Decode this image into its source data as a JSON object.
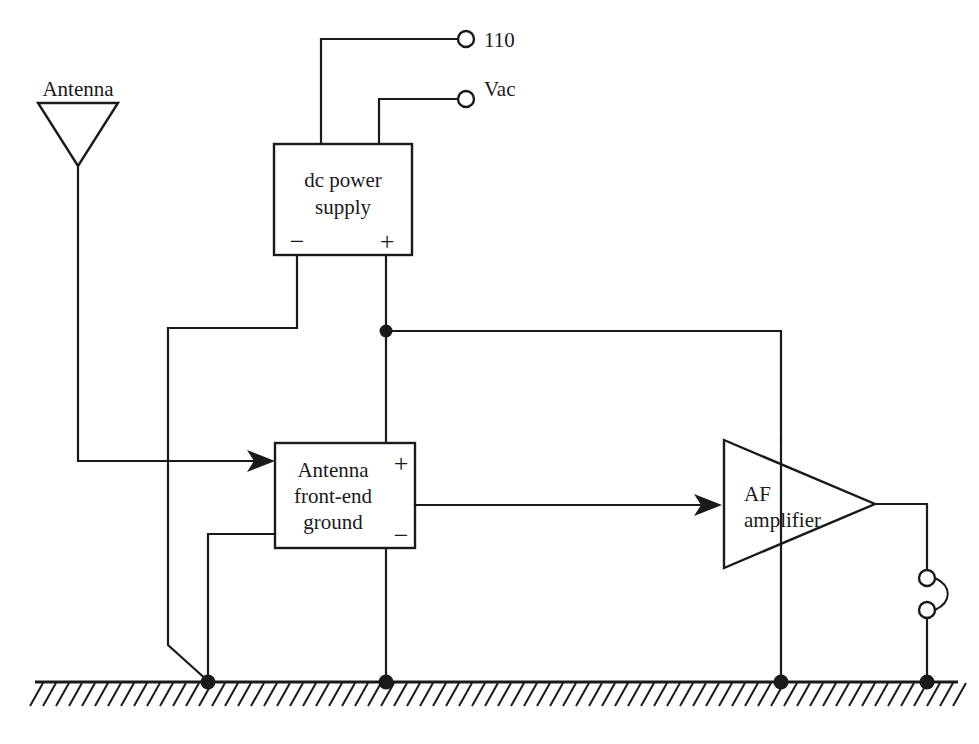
{
  "diagram": {
    "background_color": "#ffffff",
    "line_color": "#1a1a1a"
  },
  "labels": {
    "antenna": "Antenna",
    "mains_voltage_line1": "110",
    "mains_voltage_line2": "Vac",
    "dc_supply_line1": "dc power",
    "dc_supply_line2": "supply",
    "dc_supply_negative": "−",
    "dc_supply_positive": "+",
    "front_end_line1": "Antenna",
    "front_end_line2": "front-end",
    "front_end_line3": "ground",
    "front_end_positive": "+",
    "front_end_negative": "−",
    "amplifier_line1": "AF",
    "amplifier_line2": "amplifier"
  },
  "components": [
    {
      "id": "antenna",
      "name": "antenna-symbol",
      "type": "antenna",
      "label": "Antenna",
      "triangle": {
        "left_x": 38,
        "right_x": 118,
        "top_y": 103,
        "apex_x": 78,
        "apex_y": 166
      },
      "lead": {
        "x": 78,
        "from_y": 166,
        "to_y": 461
      }
    },
    {
      "id": "dc-power-supply",
      "name": "dc-power-supply-block",
      "type": "block",
      "label": "dc power supply",
      "rect": {
        "x": 274,
        "y": 144,
        "width": 138,
        "height": 111
      },
      "terminals": [
        "−",
        "+"
      ]
    },
    {
      "id": "antenna-front-end-ground",
      "name": "antenna-front-end-ground-block",
      "type": "block",
      "label": "Antenna front-end ground",
      "rect": {
        "x": 275,
        "y": 443,
        "width": 140,
        "height": 105
      },
      "terminals": [
        "+",
        "−"
      ]
    },
    {
      "id": "af-amplifier",
      "name": "af-amplifier-triangle",
      "type": "amplifier",
      "label": "AF amplifier",
      "triangle": {
        "left_x": 724,
        "top_y": 440,
        "bottom_y": 568,
        "apex_x": 875,
        "apex_y": 504
      }
    },
    {
      "id": "output-jack",
      "name": "output-jack-symbol",
      "type": "jack",
      "circles": [
        {
          "cx": 927,
          "cy": 578,
          "r": 8
        },
        {
          "cx": 927,
          "cy": 610,
          "r": 8
        }
      ]
    },
    {
      "id": "mains-terminal-top",
      "name": "mains-terminal-upper",
      "type": "terminal",
      "circle": {
        "cx": 466,
        "cy": 39,
        "r": 8
      }
    },
    {
      "id": "mains-terminal-bottom",
      "name": "mains-terminal-lower",
      "type": "terminal",
      "circle": {
        "cx": 466,
        "cy": 99,
        "r": 8
      }
    },
    {
      "id": "earth-ground",
      "name": "earth-ground-bar",
      "type": "ground",
      "line": {
        "x1": 35,
        "x2": 958,
        "y": 682
      }
    }
  ],
  "junction_dots": [
    {
      "name": "supply-positive-junction",
      "cx": 386,
      "cy": 331,
      "r": 6.5
    },
    {
      "name": "ground-node-chassis",
      "cx": 208,
      "cy": 682,
      "r": 7.5
    },
    {
      "name": "ground-node-front-end",
      "cx": 386,
      "cy": 682,
      "r": 7.5
    },
    {
      "name": "ground-node-amplifier",
      "cx": 781,
      "cy": 682,
      "r": 7.5
    },
    {
      "name": "ground-node-jack",
      "cx": 927,
      "cy": 682,
      "r": 7.5
    }
  ],
  "wires": [
    {
      "name": "supply-to-mains-upper",
      "path": "M 321,144 L 321,39 L 458,39"
    },
    {
      "name": "supply-to-mains-lower",
      "path": "M 379,144 L 379,99 L 458,99"
    },
    {
      "name": "supply-negative-lead",
      "path": "M 297,255 L 297,328 L 168,328 L 168,645 L 208,682"
    },
    {
      "name": "supply-positive-lead",
      "path": "M 386,255 L 386,443"
    },
    {
      "name": "positive-rail-to-amplifier",
      "path": "M 386,331 L 781,331 L 781,440"
    },
    {
      "name": "antenna-lead-to-front-end",
      "path": "M 78,166 L 78,461 L 260,461"
    },
    {
      "name": "front-end-negative-to-ground",
      "path": "M 275,534 L 208,534 L 208,682"
    },
    {
      "name": "front-end-bottom-to-ground",
      "path": "M 386,548 L 386,682"
    },
    {
      "name": "front-end-out-to-amplifier",
      "path": "M 415,505 L 707,505"
    },
    {
      "name": "amplifier-through-ground",
      "path": "M 781,440 L 781,682"
    },
    {
      "name": "amplifier-out-to-jack",
      "path": "M 875,504 L 927,504 L 927,570"
    },
    {
      "name": "jack-to-ground",
      "path": "M 927,618 L 927,682"
    }
  ],
  "arrows": [
    {
      "name": "antenna-input-arrow",
      "tip_x": 275,
      "tip_y": 461
    },
    {
      "name": "amplifier-input-arrow",
      "tip_x": 722,
      "tip_y": 505
    }
  ]
}
